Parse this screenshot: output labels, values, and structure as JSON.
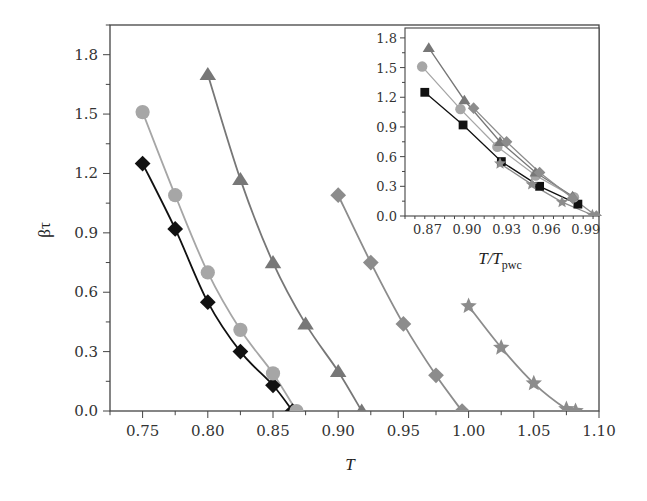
{
  "chart_data": [
    {
      "type": "line",
      "title": "",
      "xlabel": "T",
      "ylabel": "βτ",
      "xlim": [
        0.725,
        1.1
      ],
      "ylim": [
        0.0,
        1.95
      ],
      "xticks": [
        0.75,
        0.8,
        0.85,
        0.9,
        0.95,
        1.0,
        1.05,
        1.1
      ],
      "xtick_labels": [
        "0.75",
        "0.80",
        "0.85",
        "0.90",
        "0.95",
        "1.00",
        "1.05",
        "1.10"
      ],
      "yticks": [
        0.0,
        0.3,
        0.6,
        0.9,
        1.2,
        1.5,
        1.8
      ],
      "ytick_labels": [
        "0.0",
        "0.3",
        "0.6",
        "0.9",
        "1.2",
        "1.5",
        "1.8"
      ],
      "grid": false,
      "legend": null,
      "series": [
        {
          "name": "black-diamond",
          "marker": "diamond",
          "color": "#111111",
          "x": [
            0.75,
            0.775,
            0.8,
            0.825,
            0.85,
            0.865
          ],
          "y": [
            1.25,
            0.92,
            0.55,
            0.3,
            0.13,
            0.0
          ]
        },
        {
          "name": "light-circle",
          "marker": "circle",
          "color": "#a6a6a6",
          "x": [
            0.75,
            0.775,
            0.8,
            0.825,
            0.85,
            0.868
          ],
          "y": [
            1.51,
            1.09,
            0.7,
            0.41,
            0.19,
            0.0
          ]
        },
        {
          "name": "gray-triangle",
          "marker": "triangle",
          "color": "#777777",
          "x": [
            0.8,
            0.825,
            0.85,
            0.875,
            0.9,
            0.918
          ],
          "y": [
            1.7,
            1.17,
            0.75,
            0.44,
            0.2,
            0.0
          ]
        },
        {
          "name": "gray-diamond",
          "marker": "diamond",
          "color": "#8c8c8c",
          "x": [
            0.9,
            0.925,
            0.95,
            0.975,
            0.995
          ],
          "y": [
            1.09,
            0.75,
            0.44,
            0.18,
            0.0
          ]
        },
        {
          "name": "gray-star",
          "marker": "star",
          "color": "#8c8c8c",
          "x": [
            1.0,
            1.025,
            1.05,
            1.075,
            1.082
          ],
          "y": [
            0.53,
            0.32,
            0.14,
            0.01,
            0.0
          ]
        }
      ]
    },
    {
      "type": "line",
      "title": "inset",
      "xlabel": "T/T_pwc",
      "ylabel": "",
      "xlim": [
        0.853,
        1.0
      ],
      "ylim": [
        0.0,
        1.9
      ],
      "xticks": [
        0.87,
        0.9,
        0.93,
        0.96,
        0.99
      ],
      "xtick_labels": [
        "0.87",
        "0.90",
        "0.93",
        "0.96",
        "0.99"
      ],
      "yticks": [
        0.0,
        0.3,
        0.6,
        0.9,
        1.2,
        1.5,
        1.8
      ],
      "ytick_labels": [
        "0.0",
        "0.3",
        "0.6",
        "0.9",
        "1.2",
        "1.5",
        "1.8"
      ],
      "grid": false,
      "legend": null,
      "series": [
        {
          "name": "black-square",
          "marker": "square",
          "color": "#111111",
          "x": [
            0.868,
            0.897,
            0.926,
            0.955,
            0.984
          ],
          "y": [
            1.25,
            0.92,
            0.55,
            0.3,
            0.12
          ]
        },
        {
          "name": "light-circle",
          "marker": "circle",
          "color": "#a6a6a6",
          "x": [
            0.866,
            0.895,
            0.923,
            0.952,
            0.981
          ],
          "y": [
            1.51,
            1.08,
            0.7,
            0.41,
            0.19
          ]
        },
        {
          "name": "gray-triangle",
          "marker": "triangle",
          "color": "#777777",
          "x": [
            0.871,
            0.898,
            0.925,
            0.952,
            0.98
          ],
          "y": [
            1.7,
            1.17,
            0.75,
            0.44,
            0.2
          ]
        },
        {
          "name": "gray-diamond",
          "marker": "diamond",
          "color": "#8c8c8c",
          "x": [
            0.905,
            0.93,
            0.955,
            0.98,
            0.998
          ],
          "y": [
            1.09,
            0.75,
            0.44,
            0.18,
            0.0
          ]
        },
        {
          "name": "gray-star",
          "marker": "star",
          "color": "#8c8c8c",
          "x": [
            0.925,
            0.949,
            0.972,
            0.995
          ],
          "y": [
            0.53,
            0.32,
            0.14,
            0.01
          ]
        }
      ]
    }
  ],
  "labels": {
    "main_xlabel": "T",
    "main_ylabel": "βτ",
    "inset_xlabel_main": "T/T",
    "inset_xlabel_sub": "pwc"
  }
}
